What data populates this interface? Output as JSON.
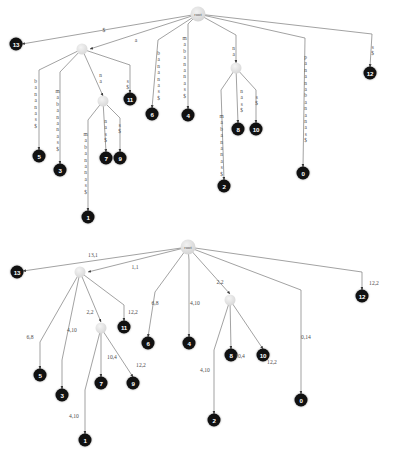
{
  "figure": {
    "background": "#ffffff",
    "node_color": "#111111",
    "internal_node_color": "#dcdcdc",
    "edge_color": "#7a7a7a",
    "label_color": "#4c4c4c",
    "root_label": "root"
  },
  "top_diagram": {
    "name": "suffix-tree-with-string-edge-labels",
    "root": {
      "label": "root",
      "x": 198,
      "y": 14
    },
    "internal_nodes": [
      {
        "name": "internal-a",
        "x": 82,
        "y": 49
      },
      {
        "name": "internal-na",
        "x": 103,
        "y": 101
      },
      {
        "name": "internal-na-right",
        "x": 236,
        "y": 68
      }
    ],
    "leaves": [
      {
        "label": "13",
        "x": 16,
        "y": 44
      },
      {
        "label": "5",
        "x": 39,
        "y": 156
      },
      {
        "label": "3",
        "x": 60,
        "y": 170
      },
      {
        "label": "1",
        "x": 88,
        "y": 217
      },
      {
        "label": "7",
        "x": 106,
        "y": 158
      },
      {
        "label": "9",
        "x": 120,
        "y": 158
      },
      {
        "label": "11",
        "x": 130,
        "y": 99
      },
      {
        "label": "6",
        "x": 152,
        "y": 114
      },
      {
        "label": "4",
        "x": 188,
        "y": 115
      },
      {
        "label": "2",
        "x": 224,
        "y": 186
      },
      {
        "label": "8",
        "x": 238,
        "y": 129
      },
      {
        "label": "10",
        "x": 256,
        "y": 129
      },
      {
        "label": "0",
        "x": 303,
        "y": 173
      },
      {
        "label": "12",
        "x": 370,
        "y": 73
      }
    ],
    "edge_labels": [
      {
        "text": "$",
        "x": 104,
        "y": 30,
        "vertical": false
      },
      {
        "text": "a",
        "x": 136,
        "y": 40,
        "vertical": false
      },
      {
        "text": "bananas$",
        "x": 35,
        "y": 78,
        "vertical": true
      },
      {
        "text": "mabananas$",
        "x": 57,
        "y": 88,
        "vertical": true
      },
      {
        "text": "na",
        "x": 100,
        "y": 72,
        "vertical": true
      },
      {
        "text": "s$",
        "x": 127,
        "y": 78,
        "vertical": true
      },
      {
        "text": "mabananas$",
        "x": 85,
        "y": 131,
        "vertical": true
      },
      {
        "text": "nas$",
        "x": 105,
        "y": 118,
        "vertical": true
      },
      {
        "text": "s$",
        "x": 119,
        "y": 122,
        "vertical": true
      },
      {
        "text": "bananas$",
        "x": 158,
        "y": 50,
        "vertical": true
      },
      {
        "text": "mabananas$",
        "x": 184,
        "y": 35,
        "vertical": true
      },
      {
        "text": "na",
        "x": 233,
        "y": 45,
        "vertical": true
      },
      {
        "text": "mabananas$",
        "x": 221,
        "y": 113,
        "vertical": true
      },
      {
        "text": "nas$",
        "x": 241,
        "y": 88,
        "vertical": true
      },
      {
        "text": "s$",
        "x": 256,
        "y": 94,
        "vertical": true
      },
      {
        "text": "pananabananas$",
        "x": 305,
        "y": 54,
        "vertical": true
      },
      {
        "text": "s$",
        "x": 372,
        "y": 44,
        "vertical": true
      }
    ],
    "edges": [
      {
        "from": [
          198,
          14
        ],
        "to": [
          22,
          44
        ],
        "arrow": true
      },
      {
        "from": [
          198,
          14
        ],
        "to": [
          90,
          49
        ],
        "arrow": true
      },
      {
        "from": [
          198,
          14
        ],
        "to": [
          158,
          40
        ],
        "arrow": false
      },
      {
        "from": [
          158,
          40
        ],
        "to": [
          152,
          108
        ],
        "arrow": true
      },
      {
        "from": [
          198,
          14
        ],
        "to": [
          188,
          24
        ],
        "arrow": false
      },
      {
        "from": [
          188,
          24
        ],
        "to": [
          188,
          109
        ],
        "arrow": true
      },
      {
        "from": [
          198,
          14
        ],
        "to": [
          236,
          35
        ],
        "arrow": false
      },
      {
        "from": [
          236,
          35
        ],
        "to": [
          236,
          63
        ],
        "arrow": true
      },
      {
        "from": [
          198,
          14
        ],
        "to": [
          305,
          38
        ],
        "arrow": false
      },
      {
        "from": [
          305,
          38
        ],
        "to": [
          303,
          167
        ],
        "arrow": true
      },
      {
        "from": [
          198,
          14
        ],
        "to": [
          372,
          34
        ],
        "arrow": false
      },
      {
        "from": [
          372,
          34
        ],
        "to": [
          370,
          67
        ],
        "arrow": true
      },
      {
        "from": [
          82,
          49
        ],
        "to": [
          39,
          70
        ],
        "arrow": false
      },
      {
        "from": [
          39,
          70
        ],
        "to": [
          39,
          150
        ],
        "arrow": true
      },
      {
        "from": [
          82,
          49
        ],
        "to": [
          60,
          72
        ],
        "arrow": false
      },
      {
        "from": [
          60,
          72
        ],
        "to": [
          60,
          164
        ],
        "arrow": true
      },
      {
        "from": [
          82,
          49
        ],
        "to": [
          103,
          96
        ],
        "arrow": true
      },
      {
        "from": [
          82,
          49
        ],
        "to": [
          130,
          65
        ],
        "arrow": false
      },
      {
        "from": [
          130,
          65
        ],
        "to": [
          130,
          93
        ],
        "arrow": true
      },
      {
        "from": [
          103,
          101
        ],
        "to": [
          88,
          120
        ],
        "arrow": false
      },
      {
        "from": [
          88,
          120
        ],
        "to": [
          88,
          211
        ],
        "arrow": true
      },
      {
        "from": [
          103,
          101
        ],
        "to": [
          106,
          152
        ],
        "arrow": true
      },
      {
        "from": [
          103,
          101
        ],
        "to": [
          120,
          118
        ],
        "arrow": false
      },
      {
        "from": [
          120,
          118
        ],
        "to": [
          120,
          152
        ],
        "arrow": true
      },
      {
        "from": [
          236,
          68
        ],
        "to": [
          221,
          90
        ],
        "arrow": false
      },
      {
        "from": [
          221,
          90
        ],
        "to": [
          224,
          180
        ],
        "arrow": true
      },
      {
        "from": [
          236,
          68
        ],
        "to": [
          238,
          123
        ],
        "arrow": true
      },
      {
        "from": [
          236,
          68
        ],
        "to": [
          256,
          90
        ],
        "arrow": false
      },
      {
        "from": [
          256,
          90
        ],
        "to": [
          256,
          123
        ],
        "arrow": true
      }
    ]
  },
  "bottom_diagram": {
    "name": "suffix-tree-with-index-length-edge-labels",
    "root": {
      "label": "root",
      "x": 188,
      "y": 247
    },
    "internal_nodes": [
      {
        "name": "internal-a",
        "x": 80,
        "y": 272
      },
      {
        "name": "internal-na",
        "x": 101,
        "y": 328
      },
      {
        "name": "internal-na-right",
        "x": 230,
        "y": 300
      }
    ],
    "leaves": [
      {
        "label": "13",
        "x": 17,
        "y": 272
      },
      {
        "label": "5",
        "x": 40,
        "y": 375
      },
      {
        "label": "3",
        "x": 62,
        "y": 395
      },
      {
        "label": "1",
        "x": 85,
        "y": 440
      },
      {
        "label": "7",
        "x": 101,
        "y": 383
      },
      {
        "label": "9",
        "x": 133,
        "y": 383
      },
      {
        "label": "11",
        "x": 124,
        "y": 327
      },
      {
        "label": "6",
        "x": 148,
        "y": 343
      },
      {
        "label": "4",
        "x": 189,
        "y": 343
      },
      {
        "label": "2",
        "x": 214,
        "y": 420
      },
      {
        "label": "8",
        "x": 231,
        "y": 355
      },
      {
        "label": "10",
        "x": 263,
        "y": 355
      },
      {
        "label": "0",
        "x": 301,
        "y": 400
      },
      {
        "label": "12",
        "x": 362,
        "y": 296
      }
    ],
    "edge_labels": [
      {
        "text": "13,1",
        "x": 93,
        "y": 255
      },
      {
        "text": "1,1",
        "x": 135,
        "y": 267
      },
      {
        "text": "6,8",
        "x": 155,
        "y": 303
      },
      {
        "text": "4,10",
        "x": 195,
        "y": 303
      },
      {
        "text": "2,2",
        "x": 220,
        "y": 282
      },
      {
        "text": "0,14",
        "x": 306,
        "y": 337
      },
      {
        "text": "12,2",
        "x": 374,
        "y": 283
      },
      {
        "text": "6,8",
        "x": 30,
        "y": 337
      },
      {
        "text": "4,10",
        "x": 72,
        "y": 330
      },
      {
        "text": "2,2",
        "x": 90,
        "y": 312
      },
      {
        "text": "12,2",
        "x": 133,
        "y": 312
      },
      {
        "text": "10,4",
        "x": 112,
        "y": 357
      },
      {
        "text": "12,2",
        "x": 141,
        "y": 365
      },
      {
        "text": "4,10",
        "x": 74,
        "y": 416
      },
      {
        "text": "4,10",
        "x": 205,
        "y": 370
      },
      {
        "text": "10,4",
        "x": 240,
        "y": 356
      },
      {
        "text": "12,2",
        "x": 272,
        "y": 362
      }
    ],
    "edges": [
      {
        "from": [
          188,
          247
        ],
        "to": [
          23,
          271
        ],
        "arrow": true
      },
      {
        "from": [
          188,
          247
        ],
        "to": [
          88,
          272
        ],
        "arrow": true
      },
      {
        "from": [
          188,
          247
        ],
        "to": [
          155,
          292
        ],
        "arrow": false
      },
      {
        "from": [
          155,
          292
        ],
        "to": [
          148,
          337
        ],
        "arrow": true
      },
      {
        "from": [
          188,
          247
        ],
        "to": [
          189,
          260
        ],
        "arrow": false
      },
      {
        "from": [
          189,
          260
        ],
        "to": [
          189,
          337
        ],
        "arrow": true
      },
      {
        "from": [
          188,
          247
        ],
        "to": [
          230,
          294
        ],
        "arrow": true
      },
      {
        "from": [
          188,
          247
        ],
        "to": [
          301,
          290
        ],
        "arrow": false
      },
      {
        "from": [
          301,
          290
        ],
        "to": [
          301,
          394
        ],
        "arrow": true
      },
      {
        "from": [
          188,
          247
        ],
        "to": [
          362,
          272
        ],
        "arrow": false
      },
      {
        "from": [
          362,
          272
        ],
        "to": [
          362,
          290
        ],
        "arrow": true
      },
      {
        "from": [
          80,
          272
        ],
        "to": [
          40,
          342
        ],
        "arrow": false
      },
      {
        "from": [
          40,
          342
        ],
        "to": [
          40,
          369
        ],
        "arrow": true
      },
      {
        "from": [
          80,
          272
        ],
        "to": [
          62,
          360
        ],
        "arrow": false
      },
      {
        "from": [
          62,
          360
        ],
        "to": [
          62,
          389
        ],
        "arrow": true
      },
      {
        "from": [
          80,
          272
        ],
        "to": [
          101,
          322
        ],
        "arrow": true
      },
      {
        "from": [
          80,
          272
        ],
        "to": [
          124,
          305
        ],
        "arrow": false
      },
      {
        "from": [
          124,
          305
        ],
        "to": [
          124,
          321
        ],
        "arrow": true
      },
      {
        "from": [
          101,
          328
        ],
        "to": [
          85,
          390
        ],
        "arrow": false
      },
      {
        "from": [
          85,
          390
        ],
        "to": [
          85,
          434
        ],
        "arrow": true
      },
      {
        "from": [
          101,
          328
        ],
        "to": [
          101,
          377
        ],
        "arrow": true
      },
      {
        "from": [
          101,
          328
        ],
        "to": [
          133,
          377
        ],
        "arrow": true
      },
      {
        "from": [
          230,
          300
        ],
        "to": [
          214,
          350
        ],
        "arrow": false
      },
      {
        "from": [
          214,
          350
        ],
        "to": [
          214,
          414
        ],
        "arrow": true
      },
      {
        "from": [
          230,
          300
        ],
        "to": [
          231,
          349
        ],
        "arrow": true
      },
      {
        "from": [
          230,
          300
        ],
        "to": [
          263,
          349
        ],
        "arrow": true
      }
    ]
  }
}
